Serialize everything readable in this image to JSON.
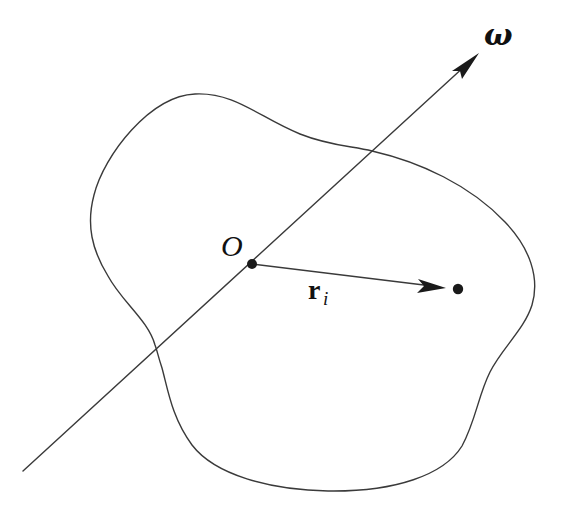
{
  "diagram": {
    "labels": {
      "axis": "ω",
      "origin": "O",
      "position_vector": "r",
      "position_vector_subscript": "i"
    },
    "elements": {
      "rotation_axis": {
        "from": [
          23,
          471
        ],
        "to": [
          479,
          53
        ],
        "arrowhead": true
      },
      "origin_point": {
        "x": 252,
        "y": 264
      },
      "particle_point": {
        "x": 458,
        "y": 289
      },
      "position_vector": {
        "from": [
          252,
          264
        ],
        "to": [
          446,
          288
        ],
        "arrowhead": true
      },
      "body_outline": "closed irregular blob"
    },
    "colors": {
      "stroke": "#3a3a3a",
      "fill_points": "#1a1a1a",
      "background": "#ffffff"
    }
  }
}
